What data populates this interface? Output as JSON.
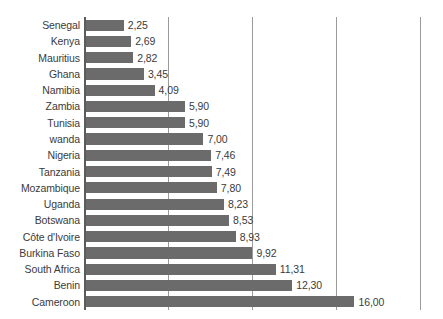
{
  "chart_data": {
    "type": "bar",
    "orientation": "horizontal",
    "title": "",
    "subtitle": "",
    "xlabel": "",
    "ylabel": "",
    "xlim": [
      0,
      21.4
    ],
    "grid": true,
    "gridlines": [
      5,
      10,
      15,
      20
    ],
    "legend": null,
    "decimal_separator": ",",
    "categories": [
      "Senegal",
      "Kenya",
      "Mauritius",
      "Ghana",
      "Namibia",
      "Zambia",
      "Tunisia",
      "wanda",
      "Nigeria",
      "Tanzania",
      "Mozambique",
      "Uganda",
      "Botswana",
      "Côte d'Ivoire",
      "Burkina Faso",
      "South Africa",
      "Benin",
      "Cameroon"
    ],
    "values": [
      2.25,
      2.69,
      2.82,
      3.45,
      4.09,
      5.9,
      5.9,
      7.0,
      7.46,
      7.49,
      7.8,
      8.23,
      8.53,
      8.93,
      9.92,
      11.31,
      12.3,
      16.0
    ],
    "value_labels": [
      "2,25",
      "2,69",
      "2,82",
      "3,45",
      "4,09",
      "5,90",
      "5,90",
      "7,00",
      "7,46",
      "7,49",
      "7,80",
      "8,23",
      "8,53",
      "8,93",
      "9,92",
      "11,31",
      "12,30",
      "16,00"
    ],
    "colors": {
      "bar": "#6b6b6b",
      "gridline": "#9b9b9b",
      "axis": "#5c5c5c",
      "text": "#3b3b3b",
      "background": "#ffffff"
    }
  }
}
